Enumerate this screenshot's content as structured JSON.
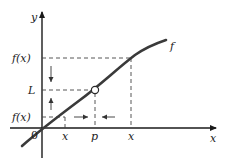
{
  "diagram": {
    "colors": {
      "axis": "#1a1a1a",
      "curve": "#3a3a3a",
      "dash": "#444444",
      "background": "#ffffff"
    },
    "labels": {
      "y_axis": "y",
      "x_axis": "x",
      "function": "f",
      "fx_upper": "f(x)",
      "limit": "L",
      "fx_lower": "f(x)",
      "origin": "0",
      "x_left": "x",
      "p": "p",
      "x_right": "x"
    },
    "elements": [
      "y-axis with arrow",
      "x-axis with arrow",
      "increasing curve f",
      "open circle at (p, L)",
      "dashed guide lines to f(x), L, f(x)",
      "arrows converging toward L on y-axis",
      "arrows converging toward p on x-axis"
    ]
  }
}
